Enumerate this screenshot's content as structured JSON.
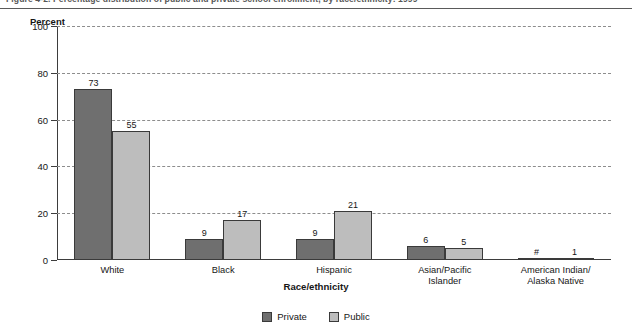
{
  "figure": {
    "title": "Figure 4-2.  Percentage distribution of public and private school enrollment, by race/ethnicity: 1999",
    "y_axis_title": "Percent",
    "x_axis_title": "Race/ethnicity"
  },
  "legend": {
    "items": [
      {
        "label": "Private",
        "color": "#6f6f6f"
      },
      {
        "label": "Public",
        "color": "#bdbdbd"
      }
    ]
  },
  "axis": {
    "y_ticks": [
      "0",
      "20",
      "40",
      "60",
      "80",
      "100"
    ]
  },
  "chart_data": {
    "type": "bar",
    "title": "Figure 4-2.  Percentage distribution of public and private school enrollment, by race/ethnicity: 1999",
    "xlabel": "Race/ethnicity",
    "ylabel": "Percent",
    "ylim": [
      0,
      100
    ],
    "yticks": [
      0,
      20,
      40,
      60,
      80,
      100
    ],
    "grid": true,
    "legend_position": "bottom",
    "categories": [
      "White",
      "Black",
      "Hispanic",
      "Asian/Pacific Islander",
      "American Indian/ Alaska Native"
    ],
    "category_lines": [
      [
        "White"
      ],
      [
        "Black"
      ],
      [
        "Hispanic"
      ],
      [
        "Asian/Pacific",
        "Islander"
      ],
      [
        "American Indian/",
        "Alaska Native"
      ]
    ],
    "series": [
      {
        "name": "Private",
        "color": "#6f6f6f",
        "values": [
          73,
          9,
          9,
          6,
          0
        ],
        "labels": [
          "73",
          "9",
          "9",
          "6",
          "#"
        ]
      },
      {
        "name": "Public",
        "color": "#bdbdbd",
        "values": [
          55,
          17,
          21,
          5,
          1
        ],
        "labels": [
          "55",
          "17",
          "21",
          "5",
          "1"
        ]
      }
    ],
    "annotations": [
      "# rounds to zero"
    ]
  }
}
